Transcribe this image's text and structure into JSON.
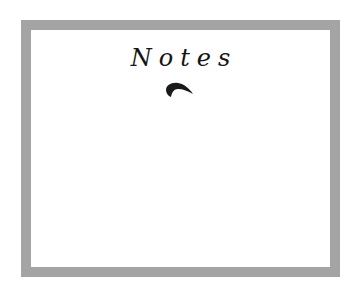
{
  "page": {
    "title": "Notes",
    "ornament_icon": "quill-icon",
    "frame_color": "#a4a4a4",
    "background": "#ffffff"
  }
}
